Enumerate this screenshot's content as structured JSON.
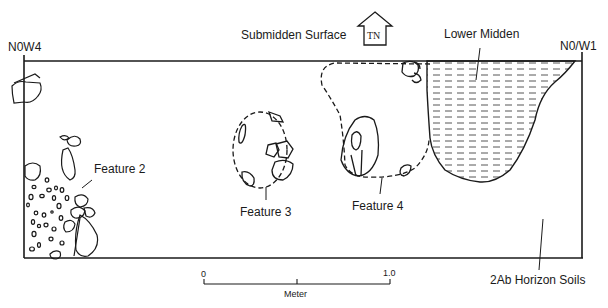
{
  "corners": {
    "northwest": "N0W4",
    "northeast": "N0/W1"
  },
  "north_arrow": {
    "label": "TN"
  },
  "labels": {
    "submidden_surface": "Submidden Surface",
    "lower_midden": "Lower Midden",
    "feature_2": "Feature 2",
    "feature_3": "Feature 3",
    "feature_4": "Feature 4",
    "horizon_soils": "2Ab Horizon Soils"
  },
  "scale_bar": {
    "start": "0",
    "end": "1.0",
    "unit": "Meter"
  },
  "colors": {
    "line": "#1a1a1a",
    "background": "#ffffff"
  }
}
